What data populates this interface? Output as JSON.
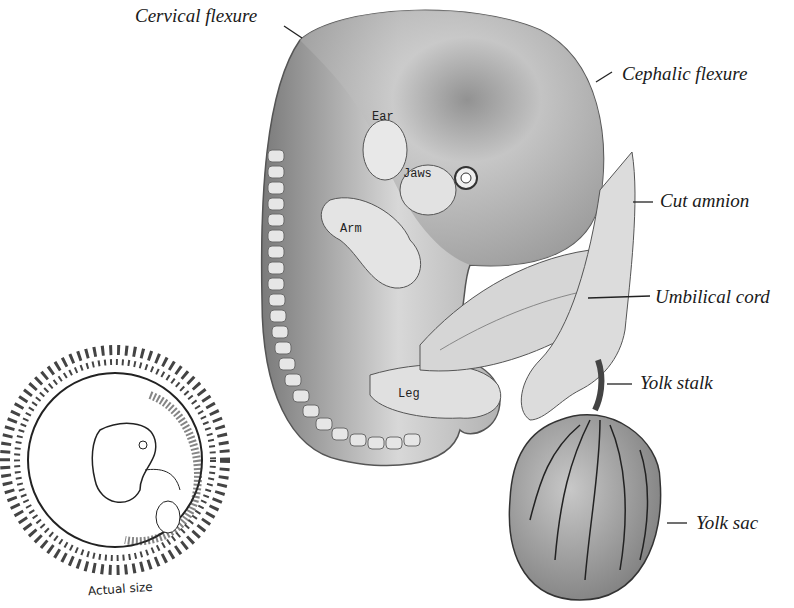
{
  "figure": {
    "colors": {
      "ink": "#1a1a1a",
      "body_light": "#dedede",
      "body_mid": "#a9a9a9",
      "body_dark": "#5e5e5e",
      "background": "#ffffff"
    }
  },
  "labels": {
    "cervical_flexure": "Cervical flexure",
    "cephalic_flexure": "Cephalic flexure",
    "cut_amnion": "Cut amnion",
    "umbilical_cord": "Umbilical cord",
    "yolk_stalk": "Yolk stalk",
    "yolk_sac": "Yolk sac"
  },
  "inner_labels": {
    "ear": "Ear",
    "jaws": "Jaws",
    "arm": "Arm",
    "leg": "Leg"
  },
  "inset": {
    "caption": "Actual size"
  }
}
